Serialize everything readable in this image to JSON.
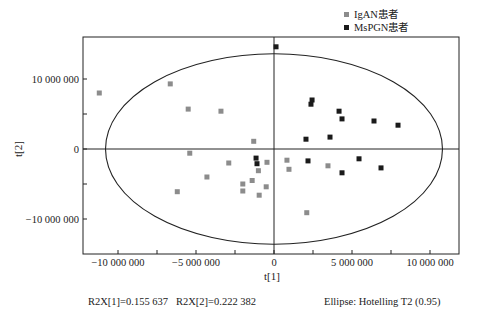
{
  "chart_data": {
    "type": "scatter",
    "title": "",
    "xlabel": "t[1]",
    "ylabel": "t[2]",
    "xlim": [
      -12200000,
      11900000
    ],
    "ylim": [
      -15000000,
      16000000
    ],
    "x_ticks": [
      -10000000,
      -5000000,
      0,
      5000000,
      10000000
    ],
    "x_tick_labels": [
      "−10 000 000",
      "−5 000 000",
      "0",
      "5 000 000",
      "10 000 000"
    ],
    "y_ticks": [
      -10000000,
      0,
      10000000
    ],
    "y_tick_labels": [
      "−10 000 000",
      "0",
      "10 000 000"
    ],
    "grid": false,
    "legend_position": "top-right",
    "ellipse": {
      "label": "Ellipse: Hotelling T2 (0.95)",
      "center": [
        0,
        0
      ],
      "rx": 10800000,
      "ry": 13600000
    },
    "series": [
      {
        "name": "IgAN患者",
        "color": "#8c8c8c",
        "marker": "square",
        "points": [
          [
            -11200000,
            8000000
          ],
          [
            -6650000,
            9300000
          ],
          [
            -5500000,
            5700000
          ],
          [
            -3400000,
            5400000
          ],
          [
            -5400000,
            -600000
          ],
          [
            -4300000,
            -4000000
          ],
          [
            -6200000,
            -6100000
          ],
          [
            -2900000,
            -2000000
          ],
          [
            -1300000,
            1100000
          ],
          [
            -450000,
            -1900000
          ],
          [
            -1000000,
            -3100000
          ],
          [
            -1400000,
            -4500000
          ],
          [
            -2000000,
            -5000000
          ],
          [
            -2000000,
            -6000000
          ],
          [
            -500000,
            -5400000
          ],
          [
            -950000,
            -6600000
          ],
          [
            830000,
            -1600000
          ],
          [
            960000,
            -2900000
          ],
          [
            3460000,
            -2400000
          ],
          [
            2100000,
            -9100000
          ]
        ]
      },
      {
        "name": "MsPGN患者",
        "color": "#1a1a1a",
        "marker": "square",
        "points": [
          [
            130000,
            14600000
          ],
          [
            2440000,
            7000000
          ],
          [
            2370000,
            6400000
          ],
          [
            4170000,
            5400000
          ],
          [
            4360000,
            4300000
          ],
          [
            6410000,
            4000000
          ],
          [
            7950000,
            3400000
          ],
          [
            2050000,
            1400000
          ],
          [
            3590000,
            1700000
          ],
          [
            2180000,
            -1700000
          ],
          [
            5450000,
            -1400000
          ],
          [
            4360000,
            -3400000
          ],
          [
            6860000,
            -2700000
          ],
          [
            -1150000,
            -1300000
          ],
          [
            -1090000,
            -2100000
          ]
        ]
      }
    ],
    "annotations": [
      "R2X[1]=0.155 637",
      "R2X[2]=0.222 382",
      "Ellipse: Hotelling T2 (0.95)"
    ]
  },
  "legend": {
    "items": [
      {
        "label": "IgAN患者",
        "color": "#8c8c8c"
      },
      {
        "label": "MsPGN患者",
        "color": "#1a1a1a"
      }
    ]
  },
  "footer": {
    "r2x1": "R2X[1]=0.155 637",
    "r2x2": "R2X[2]=0.222 382",
    "ellipse": "Ellipse: Hotelling T2 (0.95)"
  }
}
